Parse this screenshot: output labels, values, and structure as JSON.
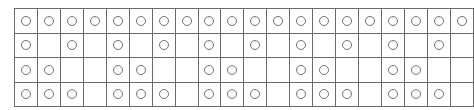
{
  "figure": {
    "kind": "circle-grid",
    "columns": 20,
    "rows": 4,
    "cell_filled_glyph": "circle-outline",
    "cell_empty_glyph": "blank",
    "colors": {
      "background": "#ffffff",
      "grid_line": "#6b6b6b",
      "frame_line": "#5a5a5a",
      "circle_stroke": "#737373",
      "circle_fill": "#ffffff"
    }
  },
  "chart_data": {
    "type": "heatmap",
    "title": "",
    "subtitle": "",
    "xlabel": "",
    "ylabel": "",
    "grid": true,
    "legend": "none",
    "columns": 20,
    "rows": 4,
    "categories": [
      1,
      2,
      3,
      4,
      5,
      6,
      7,
      8,
      9,
      10,
      11,
      12,
      13,
      14,
      15,
      16,
      17,
      18,
      19,
      20
    ],
    "row_labels": [
      "row-1",
      "row-2",
      "row-3",
      "row-4"
    ],
    "series": [
      {
        "name": "row-1",
        "period": 1,
        "count": 20,
        "values": [
          1,
          1,
          1,
          1,
          1,
          1,
          1,
          1,
          1,
          1,
          1,
          1,
          1,
          1,
          1,
          1,
          1,
          1,
          1,
          1
        ]
      },
      {
        "name": "row-2",
        "period": 2,
        "count": 10,
        "values": [
          1,
          0,
          1,
          0,
          1,
          0,
          1,
          0,
          1,
          0,
          1,
          0,
          1,
          0,
          1,
          0,
          1,
          0,
          1,
          0
        ]
      },
      {
        "name": "row-3",
        "period": 4,
        "count": 10,
        "values": [
          1,
          1,
          0,
          0,
          1,
          1,
          0,
          0,
          1,
          1,
          0,
          0,
          1,
          1,
          0,
          0,
          1,
          1,
          0,
          0
        ]
      },
      {
        "name": "row-4",
        "period": 4,
        "count": 15,
        "values": [
          1,
          1,
          1,
          0,
          1,
          1,
          1,
          0,
          1,
          1,
          1,
          0,
          1,
          1,
          1,
          0,
          1,
          1,
          1,
          0
        ]
      }
    ]
  }
}
